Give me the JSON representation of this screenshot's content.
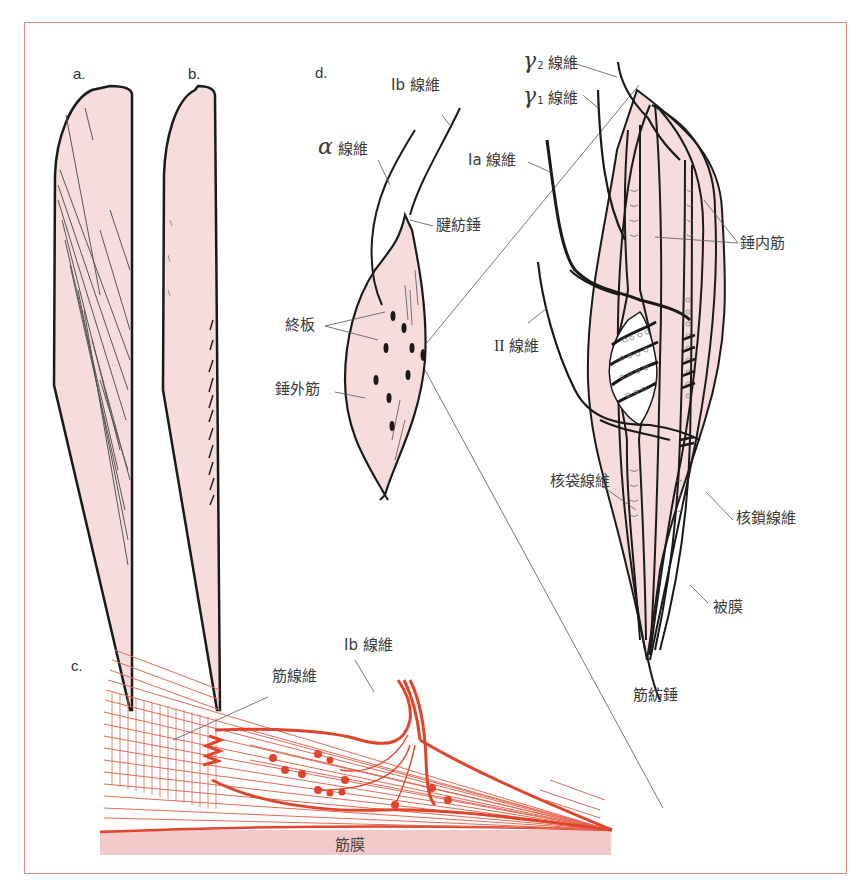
{
  "figure": {
    "panels": {
      "a": {
        "letter": "a."
      },
      "b": {
        "letter": "b."
      },
      "c": {
        "letter": "c.",
        "labels": {
          "muscle_fiber": "筋線維",
          "ib_fiber": "Ib 線維",
          "fascia": "筋膜"
        }
      },
      "d": {
        "letter": "d.",
        "labels": {
          "ib_fiber": "Ib 線維",
          "alpha_fiber_symbol": "α",
          "alpha_fiber_text": "線維",
          "tendon_spindle": "腱紡錘",
          "end_plate": "終板",
          "extrafusal_muscle": "錘外筋",
          "gamma2_symbol": "γ",
          "gamma2_sub": "2",
          "gamma2_text": "線維",
          "gamma1_symbol": "γ",
          "gamma1_sub": "1",
          "gamma1_text": "線維",
          "ia_fiber": "Ia 線維",
          "ii_fiber_roman": "II",
          "ii_fiber_text": "線維",
          "intrafusal_muscle": "錘内筋",
          "nuclear_bag_fiber": "核袋線維",
          "nuclear_chain_fiber": "核鎖線維",
          "capsule": "被膜",
          "muscle_spindle": "筋紡錘"
        }
      }
    },
    "colors": {
      "frame": "#e58a8a",
      "muscle_fill": "#f6dcdc",
      "outline": "#1a1a1a",
      "tendon_red": "#e0452c",
      "fascia_fill": "#f4c9c9",
      "leader_line": "#555555"
    }
  }
}
